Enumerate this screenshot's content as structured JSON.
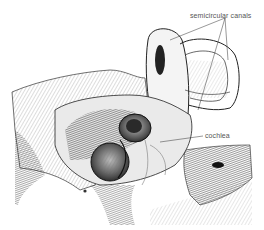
{
  "figure": {
    "labels": {
      "semicircular_canals": "semicircular canals",
      "cochlea": "cochlea"
    },
    "colors": {
      "ink": "#1a1a1a",
      "mid": "#6b6b6b",
      "light": "#c8c8c8",
      "paper": "#ffffff",
      "label_text": "#555555"
    }
  }
}
